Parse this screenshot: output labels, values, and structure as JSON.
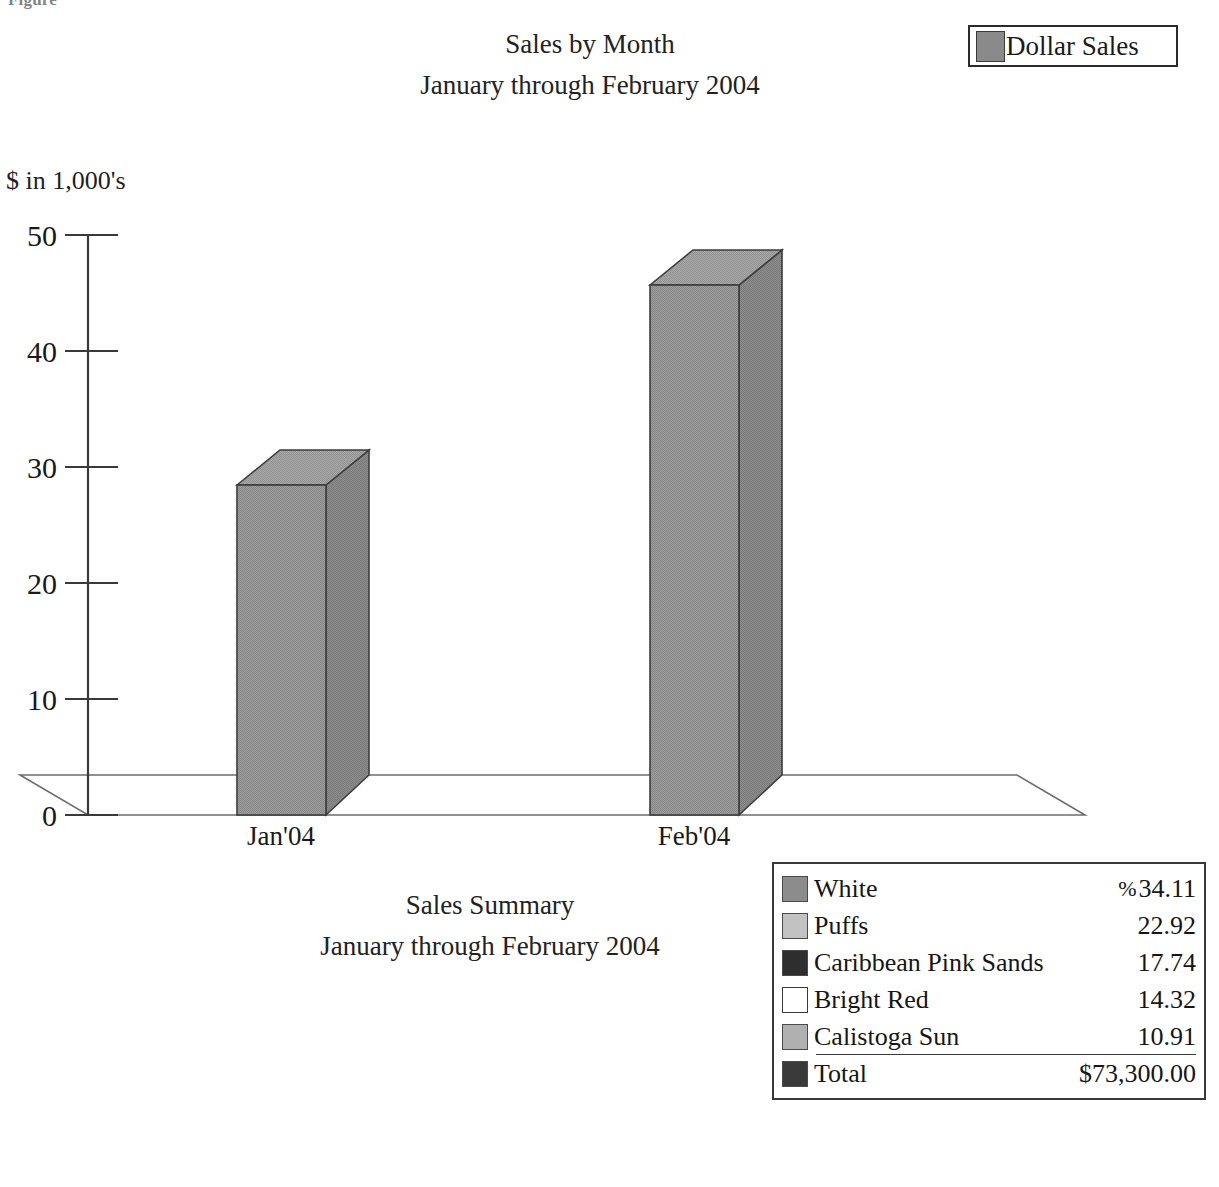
{
  "figure_caption": "Figure",
  "header": {
    "title_lines": [
      "Sales by Month",
      "January through February 2004"
    ],
    "series_legend": {
      "label": "Dollar Sales",
      "swatch_color": "#8a8a8a",
      "swatch_name": "dollar-sales-swatch"
    }
  },
  "summary": {
    "title_lines": [
      "Sales Summary",
      "January through February 2004"
    ]
  },
  "breakdown": {
    "percent_sign": "%",
    "rows": [
      {
        "name": "White",
        "value": "34.11",
        "color": "#8c8c8c",
        "show_percent": true,
        "underline": false
      },
      {
        "name": "Puffs",
        "value": "22.92",
        "color": "#c2c2c2",
        "show_percent": false,
        "underline": false
      },
      {
        "name": "Caribbean Pink Sands",
        "value": "17.74",
        "color": "#2e2e2e",
        "show_percent": false,
        "underline": false
      },
      {
        "name": "Bright Red",
        "value": "14.32",
        "color": "#ffffff",
        "show_percent": false,
        "underline": false
      },
      {
        "name": "Calistoga Sun",
        "value": "10.91",
        "color": "#b0b0b0",
        "show_percent": false,
        "underline": true
      },
      {
        "name": "Total",
        "value": "$73,300.00",
        "color": "#3a3a3a",
        "show_percent": false,
        "underline": false
      }
    ]
  },
  "chart_data": {
    "type": "bar",
    "title": "Sales by Month",
    "subtitle": "January through February 2004",
    "categories": [
      "Jan'04",
      "Feb'04"
    ],
    "values": [
      28.4,
      45.7
    ],
    "series": [
      {
        "name": "Dollar Sales",
        "values": [
          28.4,
          45.7
        ]
      }
    ],
    "xlabel": "",
    "ylabel": "$ in 1,000's",
    "ylim": [
      0,
      50
    ],
    "yticks": [
      0,
      10,
      20,
      30,
      40,
      50
    ],
    "ytick_labels": [
      "0",
      "10",
      "20",
      "30",
      "40",
      "50"
    ],
    "grid": false,
    "legend_position": "top-right",
    "style": "3d-column",
    "bar_color": "#8f8f8f",
    "bar_top_color": "#9a9a9a",
    "bar_side_color": "#7e7e7e",
    "units_note": "$ in 1,000's"
  }
}
